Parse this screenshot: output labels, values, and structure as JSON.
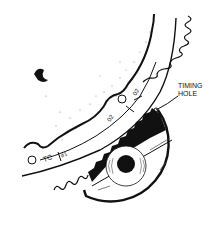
{
  "diagram": {
    "callout": {
      "line1": "TIMING",
      "line2": "HOLE"
    },
    "ring_marks": {
      "tc": "TC",
      "cyl1": "#1",
      "mark_a": "02",
      "mark_b": "02"
    },
    "colors": {
      "ink": "#111111",
      "background": "#ffffff"
    }
  }
}
